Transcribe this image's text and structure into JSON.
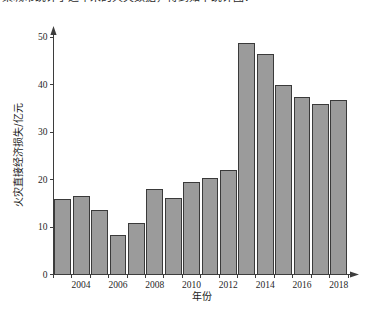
{
  "page": {
    "clipped_header_text": "某城市统计了近年来的火灾数据，得到如下统计图："
  },
  "chart_data": {
    "type": "bar",
    "title": "",
    "xlabel": "年份",
    "ylabel": "火灾直接经济损失/亿元",
    "categories": [
      "2003",
      "2004",
      "2005",
      "2006",
      "2007",
      "2008",
      "2009",
      "2010",
      "2011",
      "2012",
      "2013",
      "2014",
      "2015",
      "2016",
      "2017",
      "2018"
    ],
    "values": [
      15.8,
      16.5,
      13.5,
      8.2,
      10.8,
      18.0,
      15.9,
      19.4,
      20.3,
      21.8,
      48.7,
      46.4,
      39.7,
      37.3,
      35.8,
      36.6
    ],
    "x_tick_labels": [
      "2004",
      "2006",
      "2008",
      "2010",
      "2012",
      "2014",
      "2016",
      "2018"
    ],
    "y_tick_labels": [
      "0",
      "10",
      "20",
      "30",
      "40",
      "50"
    ],
    "y_ticks": [
      0,
      10,
      20,
      30,
      40,
      50
    ],
    "ylim": [
      0,
      52
    ],
    "grid": false,
    "legend": "none",
    "bar_fill_color": "#9b9b9b",
    "bar_stroke_color": "#3a3a3a",
    "axis_color": "#3d3d3d",
    "background_color": "#ffffff"
  }
}
